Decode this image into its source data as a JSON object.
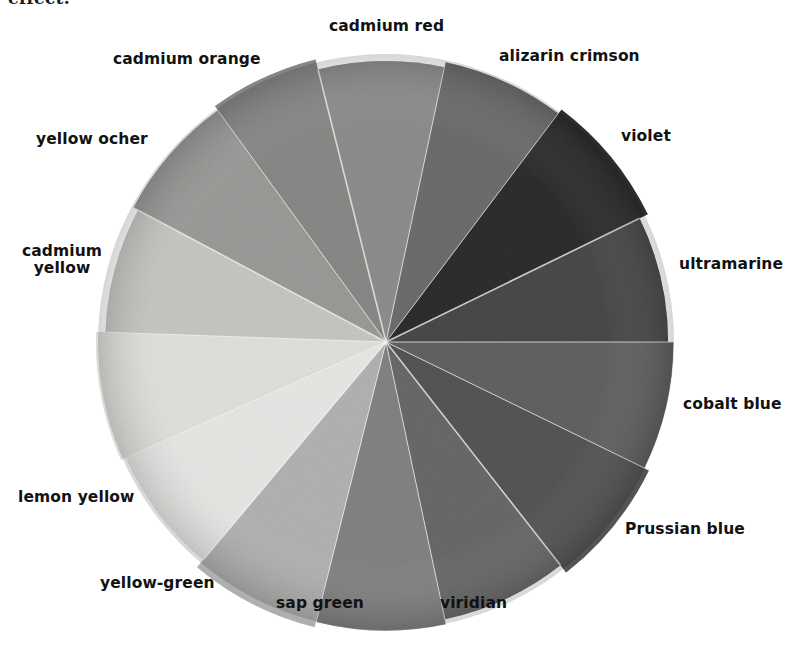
{
  "page": {
    "background_color": "#ffffff",
    "body_text_fragment": "effect."
  },
  "figure": {
    "name": "pigment-color-wheel",
    "center_x": 386,
    "center_y": 342,
    "radius": 288,
    "segment_count": 14,
    "rendering": "grayscale photograph of painted color wheel"
  },
  "labels": {
    "cadmium_red": "cadmium red",
    "alizarin_crimson": "alizarin crimson",
    "violet": "violet",
    "ultramarine": "ultramarine",
    "cobalt_blue": "cobalt blue",
    "prussian_blue": "Prussian blue",
    "viridian": "viridian",
    "sap_green": "sap green",
    "yellow_green": "yellow-green",
    "lemon_yellow": "lemon yellow",
    "cadmium_yellow_l1": "cadmium",
    "cadmium_yellow_l2": "yellow",
    "yellow_ocher": "yellow ocher",
    "cadmium_orange": "cadmium orange"
  },
  "chart_data": {
    "type": "pie",
    "xlabel": "",
    "ylabel": "",
    "legend_position": "around-perimeter",
    "grid": false,
    "categories": [
      "cadmium red",
      "alizarin crimson",
      "violet",
      "ultramarine",
      "cobalt blue",
      "Prussian blue",
      "viridian",
      "sap green",
      "yellow-green",
      "lemon yellow",
      "cadmium yellow",
      "yellow ocher",
      "cadmium orange",
      "cadmium red (warm)"
    ],
    "values": [
      7.14,
      7.14,
      7.14,
      7.14,
      7.14,
      7.14,
      7.14,
      7.14,
      7.14,
      7.14,
      7.14,
      7.14,
      7.14,
      7.14
    ],
    "segments": [
      {
        "label": "cadmium red",
        "start_angle": -14,
        "end_angle": 12,
        "gray": "#8f8f8f"
      },
      {
        "label": "alizarin crimson",
        "start_angle": 12,
        "end_angle": 37,
        "gray": "#6e6e6e"
      },
      {
        "label": "violet",
        "start_angle": 37,
        "end_angle": 64,
        "gray": "#2e2e2e"
      },
      {
        "label": "ultramarine",
        "start_angle": 64,
        "end_angle": 90,
        "gray": "#4a4a4a"
      },
      {
        "label": "cobalt blue",
        "start_angle": 90,
        "end_angle": 116,
        "gray": "#636363"
      },
      {
        "label": "Prussian blue",
        "start_angle": 116,
        "end_angle": 142,
        "gray": "#565656"
      },
      {
        "label": "viridian",
        "start_angle": 142,
        "end_angle": 168,
        "gray": "#6a6a6a"
      },
      {
        "label": "sap green",
        "start_angle": 168,
        "end_angle": 194,
        "gray": "#848484"
      },
      {
        "label": "yellow-green",
        "start_angle": 194,
        "end_angle": 220,
        "gray": "#b4b4b4"
      },
      {
        "label": "lemon yellow",
        "start_angle": 220,
        "end_angle": 246,
        "gray": "#e9e9e7"
      },
      {
        "label": "cadmium yellow",
        "start_angle": 246,
        "end_angle": 272,
        "gray": "#e2e2de"
      },
      {
        "label": "yellow ocher",
        "start_angle": 272,
        "end_angle": 298,
        "gray": "#c8c8c4"
      },
      {
        "label": "cadmium orange",
        "start_angle": 298,
        "end_angle": 324,
        "gray": "#9c9c9a"
      },
      {
        "label": "cadmium red warm",
        "start_angle": 324,
        "end_angle": 346,
        "gray": "#8a8a88"
      }
    ]
  },
  "label_positions": {
    "cadmium_red": {
      "x": 329,
      "y": 18,
      "align": "left"
    },
    "alizarin_crimson": {
      "x": 499,
      "y": 48,
      "align": "left"
    },
    "violet": {
      "x": 621,
      "y": 128,
      "align": "left"
    },
    "ultramarine": {
      "x": 679,
      "y": 256,
      "align": "left"
    },
    "cobalt_blue": {
      "x": 683,
      "y": 396,
      "align": "left"
    },
    "prussian_blue": {
      "x": 625,
      "y": 521,
      "align": "left"
    },
    "viridian": {
      "x": 440,
      "y": 595,
      "align": "left"
    },
    "sap_green": {
      "x": 276,
      "y": 595,
      "align": "left"
    },
    "yellow_green": {
      "x": 100,
      "y": 575,
      "align": "left"
    },
    "lemon_yellow": {
      "x": 18,
      "y": 489,
      "align": "left"
    },
    "cadmium_yellow": {
      "x": 22,
      "y": 243,
      "align": "left"
    },
    "yellow_ocher": {
      "x": 36,
      "y": 131,
      "align": "left"
    },
    "cadmium_orange": {
      "x": 113,
      "y": 51,
      "align": "left"
    }
  }
}
